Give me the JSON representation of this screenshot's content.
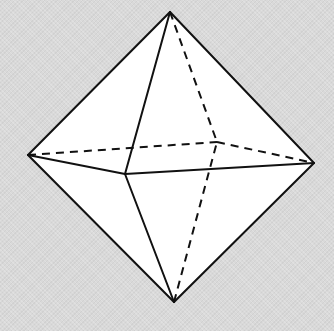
{
  "diagram": {
    "background_color": "#d9d9d9",
    "face_color": "#ffffff",
    "line_color": "#111111",
    "vertices": {
      "top": [
        170,
        12
      ],
      "bottom": [
        174,
        302
      ],
      "left": [
        28,
        155
      ],
      "right": [
        314,
        163
      ],
      "front": [
        125,
        174
      ],
      "back": [
        217,
        142
      ]
    },
    "visible_edges": [
      [
        "top",
        "left"
      ],
      [
        "top",
        "right"
      ],
      [
        "top",
        "front"
      ],
      [
        "bottom",
        "left"
      ],
      [
        "bottom",
        "right"
      ],
      [
        "bottom",
        "front"
      ],
      [
        "left",
        "front"
      ],
      [
        "front",
        "right"
      ]
    ],
    "hidden_edges": [
      [
        "top",
        "back"
      ],
      [
        "bottom",
        "back"
      ],
      [
        "left",
        "back"
      ],
      [
        "back",
        "right"
      ]
    ]
  }
}
